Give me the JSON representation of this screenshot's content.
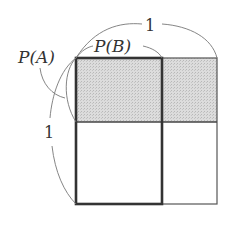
{
  "diagram": {
    "type": "probability-area-model",
    "labels": {
      "p_a": "P(A)",
      "p_b": "P(B)",
      "top_one": "1",
      "left_one": "1"
    },
    "regions": [
      {
        "name": "A-and-B",
        "shaded": true
      },
      {
        "name": "A-and-not-B",
        "shaded": true
      },
      {
        "name": "not-A-and-B",
        "shaded": false
      },
      {
        "name": "not-A-and-not-B",
        "shaded": false
      }
    ],
    "colors": {
      "shade": "#d4d4d4",
      "thin_line": "#555555",
      "thick_line": "#333333",
      "arc": "#777777",
      "text": "#333333"
    }
  }
}
